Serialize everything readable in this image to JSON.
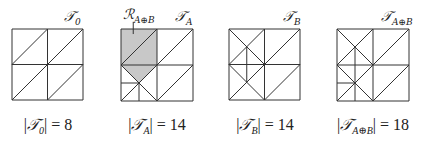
{
  "figure": {
    "panels": [
      {
        "id": "T0",
        "label_main": "𝒯",
        "label_sub": "0",
        "caption_prefix": "|",
        "caption_suffix": "| = 8",
        "triangle_count": 8,
        "box": {
          "x": 12,
          "y": 29,
          "size": 71
        }
      },
      {
        "id": "TA",
        "label_main": "𝒯",
        "label_sub": "A",
        "caption_prefix": "|",
        "caption_suffix": "| = 14",
        "triangle_count": 14,
        "box": {
          "x": 121,
          "y": 29,
          "size": 72
        },
        "region_label_main": "ℛ",
        "region_label_sub": "A⊕B",
        "region_fill": "#c8c8c8"
      },
      {
        "id": "TB",
        "label_main": "𝒯",
        "label_sub": "B",
        "caption_prefix": "|",
        "caption_suffix": "| = 14",
        "triangle_count": 14,
        "box": {
          "x": 229,
          "y": 29,
          "size": 71
        }
      },
      {
        "id": "TAB",
        "label_main": "𝒯",
        "label_sub": "A⊕B",
        "caption_prefix": "|",
        "caption_suffix": "| = 18",
        "triangle_count": 18,
        "box": {
          "x": 337,
          "y": 29,
          "size": 72
        }
      }
    ],
    "line_color": "#333333"
  }
}
